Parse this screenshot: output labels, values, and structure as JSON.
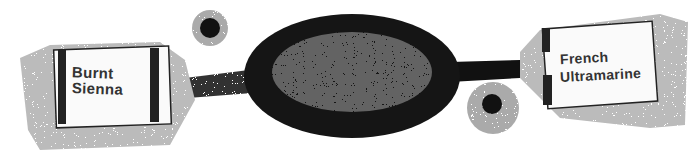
{
  "illustration": {
    "description": "Stippled ink sketch of a palette knife / squeezed paint blob connecting two paint tubes",
    "left_tube": {
      "brand": "Winsor & Newton",
      "line1": "Burnt",
      "line2": "Sienna"
    },
    "right_tube": {
      "brand": "Winsor & Newton",
      "line1": "French",
      "line2": "Ultramarine"
    },
    "colors": {
      "ink": "#111111",
      "paper": "#ffffff",
      "grey": "#888888"
    }
  }
}
